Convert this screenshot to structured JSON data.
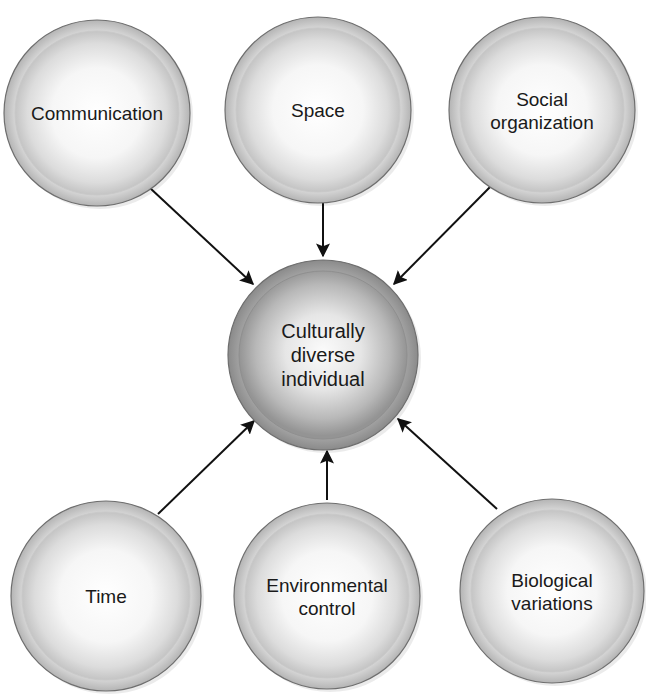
{
  "diagram": {
    "type": "hub-and-spoke",
    "center": {
      "id": "center",
      "lines": [
        "Culturally",
        "diverse",
        "individual"
      ],
      "cx": 323,
      "cy": 355,
      "r": 95
    },
    "nodes": [
      {
        "id": "communication",
        "lines": [
          "Communication"
        ],
        "cx": 97,
        "cy": 113,
        "r": 93,
        "arrow": {
          "x1": 150,
          "y1": 188,
          "x2": 253,
          "y2": 284
        }
      },
      {
        "id": "space",
        "lines": [
          "Space"
        ],
        "cx": 318,
        "cy": 110,
        "r": 93,
        "arrow": {
          "x1": 323,
          "y1": 203,
          "x2": 323,
          "y2": 256
        }
      },
      {
        "id": "social-organization",
        "lines": [
          "Social",
          "organization"
        ],
        "cx": 542,
        "cy": 110,
        "r": 93,
        "arrow": {
          "x1": 493,
          "y1": 184,
          "x2": 394,
          "y2": 284
        }
      },
      {
        "id": "time",
        "lines": [
          "Time"
        ],
        "cx": 106,
        "cy": 596,
        "r": 95,
        "arrow": {
          "x1": 158,
          "y1": 514,
          "x2": 254,
          "y2": 421
        }
      },
      {
        "id": "environmental-control",
        "lines": [
          "Environmental",
          "control"
        ],
        "cx": 327,
        "cy": 596,
        "r": 93,
        "arrow": {
          "x1": 327,
          "y1": 500,
          "x2": 327,
          "y2": 451
        }
      },
      {
        "id": "biological-variations",
        "lines": [
          "Biological",
          "variations"
        ],
        "cx": 552,
        "cy": 591,
        "r": 92,
        "arrow": {
          "x1": 497,
          "y1": 509,
          "x2": 398,
          "y2": 419
        }
      }
    ],
    "colors": {
      "node_fill_inner": "#ffffff",
      "node_fill_outer": "#c8c8c8",
      "node_ring": "#bdbdbd",
      "node_outline": "#6e6e6e",
      "center_fill_inner": "#f4f4f4",
      "center_fill_outer": "#8e8e8e",
      "center_ring": "#9a9a9a",
      "arrow": "#111111",
      "text": "#1a1a1a"
    }
  }
}
